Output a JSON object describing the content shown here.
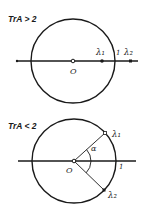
{
  "diagrams": [
    {
      "condition": "TrA > 2",
      "center_label": "O",
      "unit_label": "1",
      "eigen1_label": "λ₁",
      "eigen2_label": "λ₂",
      "description": "Real eigenvalues on the axis: λ1 inside the unit circle, λ2 outside"
    },
    {
      "condition": "TrA < 2",
      "center_label": "O",
      "unit_label": "1",
      "eigen1_label": "λ₁",
      "eigen2_label": "λ₂",
      "angle_label": "α",
      "description": "Complex conjugate eigenvalues on the unit circle at angle ±α"
    }
  ],
  "colors": {
    "ink": "#1a1a1a",
    "background": "#ffffff"
  }
}
